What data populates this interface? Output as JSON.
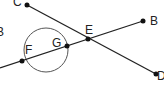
{
  "diagram": {
    "labels": {
      "C": "C",
      "B_left": "B",
      "F": "F",
      "G": "G",
      "E": "E",
      "B": "B",
      "D": "D"
    },
    "points": {
      "C": [
        27,
        5
      ],
      "F": [
        22,
        61
      ],
      "G": [
        67,
        45
      ],
      "E": [
        88,
        39
      ],
      "B": [
        143,
        21
      ],
      "D": [
        156,
        74
      ]
    },
    "circle": {
      "cx": 46,
      "cy": 50,
      "r": 22
    },
    "colors": {
      "line": "#222222",
      "circle": "#555555"
    }
  }
}
